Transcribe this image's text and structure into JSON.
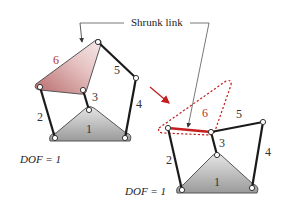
{
  "callout": {
    "text": "Shrunk link"
  },
  "left_mechanism": {
    "links": {
      "ground": "1",
      "l2": "2",
      "l3": "3",
      "l4": "4",
      "l5": "5",
      "l6": "6"
    },
    "dof_label": "DOF = 1"
  },
  "right_mechanism": {
    "links": {
      "ground": "1",
      "l2": "2",
      "l3": "3",
      "l4": "4",
      "l5": "5",
      "l6": "6"
    },
    "dof_label": "DOF = 1"
  },
  "colors": {
    "link": "#1a1a1a",
    "highlight": "#c41e1e",
    "ground_fill": "#a8a8a8",
    "shrunk_fill": "#c87a7a"
  }
}
